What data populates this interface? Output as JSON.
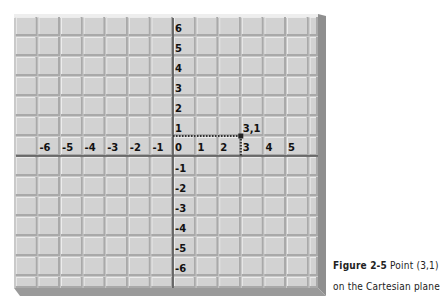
{
  "figure": {
    "number_label": "Figure 2-5",
    "title_line1": "Point (3,1)",
    "title_line2": "on the Cartesian plane"
  },
  "colors": {
    "tile": "#d2d2d2",
    "tile_highlight": "#ececec",
    "tile_shadow": "#a9a9a9",
    "axis": "#555555",
    "panel_edge": "#9a9a9a",
    "panel_bevel_light": "#eeeeee",
    "dotted_line": "#333333"
  },
  "chart_data": {
    "type": "scatter",
    "title": "Point (3,1) on the Cartesian plane",
    "xlabel": "",
    "ylabel": "",
    "xlim": [
      -6,
      6
    ],
    "ylim": [
      -6,
      6
    ],
    "x_ticks": [
      "-6",
      "-5",
      "-4",
      "-3",
      "-2",
      "-1",
      "0",
      "1",
      "2",
      "3",
      "4",
      "5"
    ],
    "y_ticks": [
      "6",
      "5",
      "4",
      "3",
      "2",
      "1",
      "-1",
      "-2",
      "-3",
      "-4",
      "-5",
      "-6"
    ],
    "grid": true,
    "points": [
      {
        "x": 3,
        "y": 1,
        "label": "3,1"
      }
    ],
    "guides": [
      {
        "type": "dotted",
        "from": [
          0,
          1
        ],
        "to": [
          3,
          1
        ]
      },
      {
        "type": "dotted",
        "from": [
          3,
          1
        ],
        "to": [
          3,
          0
        ]
      }
    ]
  }
}
